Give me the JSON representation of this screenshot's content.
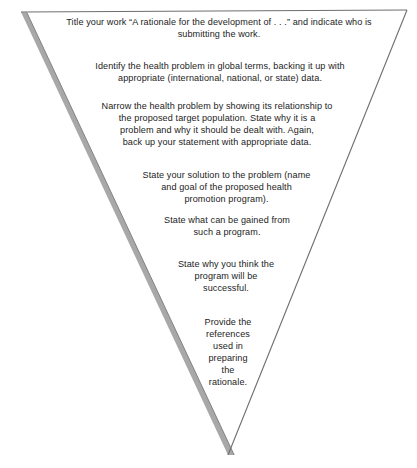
{
  "diagram": {
    "shape": "inverted-triangle",
    "background_color": "#ffffff",
    "text_color": "#1c1c1c",
    "outline_color": "#5a5a5a",
    "shadow_color": "#a8a8a8",
    "geometry": {
      "top_left": [
        21,
        12
      ],
      "top_right": [
        407,
        10
      ],
      "bottom_vertex": [
        228,
        455
      ]
    },
    "steps": [
      {
        "index": 1,
        "name": "title-step",
        "text": "Title your work “A rationale for the development of . . .” and indicate who is\nsubmitting the work."
      },
      {
        "index": 2,
        "name": "identify-problem-step",
        "text": "Identify the health problem in global terms, backing it up with\nappropriate (international, national, or state) data."
      },
      {
        "index": 3,
        "name": "narrow-problem-step",
        "text": "Narrow the health problem by showing its relationship to\nthe proposed target population.  State why it is a\nproblem and why it should be dealt with. Again,\nback up your statement with appropriate data."
      },
      {
        "index": 4,
        "name": "state-solution-step",
        "text": "State your solution to the problem (name\nand goal of the proposed health\npromotion program)."
      },
      {
        "index": 5,
        "name": "state-gains-step",
        "text": "State what can be gained from\nsuch a program."
      },
      {
        "index": 6,
        "name": "state-success-step",
        "text": "State why you think the\nprogram will be\nsuccessful."
      },
      {
        "index": 7,
        "name": "provide-references-step",
        "text": "Provide the\nreferences\nused in\npreparing\nthe\nrationale."
      }
    ]
  }
}
